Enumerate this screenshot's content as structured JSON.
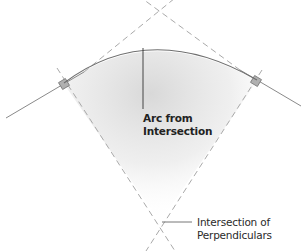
{
  "diagram": {
    "type": "geometric-construction",
    "labels": {
      "arc_label_line1": "Arc from",
      "arc_label_line2": "Intersection",
      "perp_label_line1": "Intersection of",
      "perp_label_line2": "Perpendiculars"
    },
    "colors": {
      "line": "#8a8a8a",
      "dashed": "#a9a9a9",
      "arc": "#7a7a7a",
      "shading": "#dcdcdc",
      "marker": "#9a9a9a",
      "text": "#222222"
    },
    "elements": [
      "tangent-line-left",
      "tangent-line-right",
      "dashed-extension-left",
      "dashed-extension-right",
      "perpendicular-left",
      "perpendicular-right",
      "right-angle-marker-left",
      "right-angle-marker-right",
      "arc",
      "radius-line",
      "shaded-sector",
      "leader-line"
    ]
  }
}
